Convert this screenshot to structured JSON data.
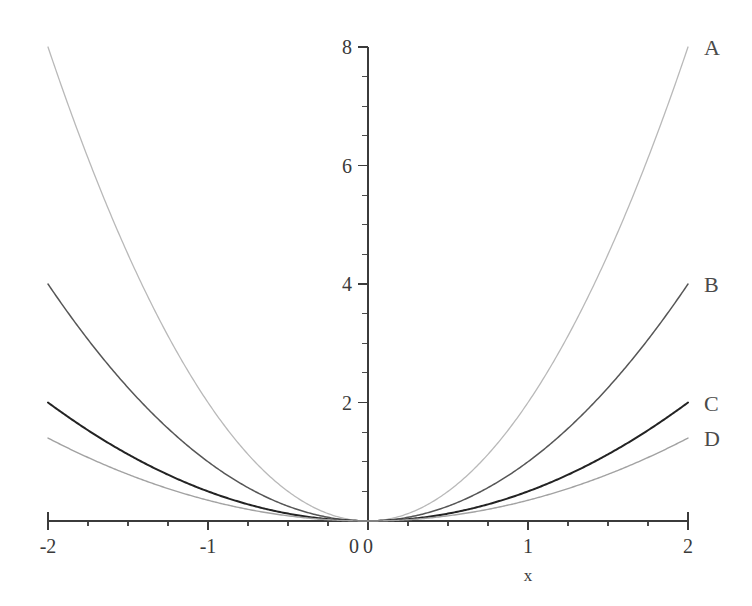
{
  "chart_data": {
    "type": "line",
    "title": "",
    "subtitle": "",
    "xlabel": "x",
    "ylabel": "",
    "xlim": [
      -2,
      2
    ],
    "ylim": [
      0,
      8
    ],
    "grid": false,
    "legend_position": "right-end-of-curve",
    "x_ticks": [
      -2,
      -1,
      0,
      1,
      2
    ],
    "x_tick_labels": [
      "-2",
      "-1",
      "0",
      "1",
      "2"
    ],
    "x_minor_tick_step": 0.25,
    "y_ticks": [
      0,
      2,
      4,
      6,
      8
    ],
    "y_tick_labels": [
      "0",
      "2",
      "4",
      "6",
      "8"
    ],
    "y_minor_tick_step": 0.5,
    "x": [
      -2,
      -1.75,
      -1.5,
      -1.25,
      -1,
      -0.75,
      -0.5,
      -0.25,
      0,
      0.25,
      0.5,
      0.75,
      1,
      1.25,
      1.5,
      1.75,
      2
    ],
    "series": [
      {
        "name": "A",
        "label": "A",
        "coefficient": 2,
        "color": "#b9b9b9",
        "width": 1.3,
        "value_at_x2": 8,
        "values": [
          8,
          6.125,
          4.5,
          3.125,
          2,
          1.125,
          0.5,
          0.125,
          0,
          0.125,
          0.5,
          1.125,
          2,
          3.125,
          4.5,
          6.125,
          8
        ]
      },
      {
        "name": "B",
        "label": "B",
        "coefficient": 1,
        "color": "#565656",
        "width": 1.5,
        "value_at_x2": 4,
        "values": [
          4,
          3.0625,
          2.25,
          1.5625,
          1,
          0.5625,
          0.25,
          0.0625,
          0,
          0.0625,
          0.25,
          0.5625,
          1,
          1.5625,
          2.25,
          3.0625,
          4
        ]
      },
      {
        "name": "C",
        "label": "C",
        "coefficient": 0.5,
        "color": "#232323",
        "width": 2.0,
        "value_at_x2": 2,
        "values": [
          2,
          1.53125,
          1.125,
          0.78125,
          0.5,
          0.28125,
          0.125,
          0.03125,
          0,
          0.03125,
          0.125,
          0.28125,
          0.5,
          0.78125,
          1.125,
          1.53125,
          2
        ]
      },
      {
        "name": "D",
        "label": "D",
        "coefficient": 0.35,
        "color": "#a2a2a2",
        "width": 1.4,
        "value_at_x2": 1.4,
        "values": [
          1.4,
          1.0719,
          0.7875,
          0.5469,
          0.35,
          0.1969,
          0.0875,
          0.0219,
          0,
          0.0219,
          0.0875,
          0.1969,
          0.35,
          0.5469,
          0.7875,
          1.0719,
          1.4
        ]
      }
    ],
    "curve_labels": [
      {
        "text": "A",
        "series": "A"
      },
      {
        "text": "B",
        "series": "B"
      },
      {
        "text": "C",
        "series": "C"
      },
      {
        "text": "D",
        "series": "D"
      }
    ],
    "axis_color": "#3b3b3b",
    "background_color": "#ffffff"
  }
}
